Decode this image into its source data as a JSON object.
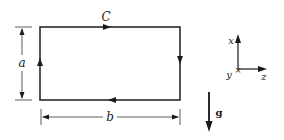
{
  "diagram": {
    "loop": {
      "label": "C",
      "shape": "rectangle",
      "direction": "clockwise"
    },
    "dimensions": {
      "height_label": "a",
      "width_label": "b"
    },
    "axes": {
      "x_label": "x",
      "y_label": "y",
      "z_label": "z"
    },
    "gravity": {
      "label": "g",
      "direction": "down"
    },
    "colors": {
      "ink": "#1a1a1a",
      "background": "#ffffff"
    }
  }
}
